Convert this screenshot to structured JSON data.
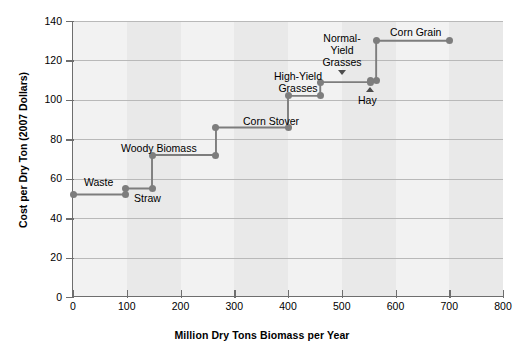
{
  "chart_data": {
    "type": "line",
    "title": "",
    "xlabel": "Million Dry Tons Biomass per Year",
    "ylabel": "Cost per Dry Ton (2007 Dollars)",
    "xlim": [
      0,
      800
    ],
    "ylim": [
      0,
      140
    ],
    "xticks": [
      0,
      100,
      200,
      300,
      400,
      500,
      600,
      700,
      800
    ],
    "yticks": [
      0,
      20,
      40,
      60,
      80,
      100,
      120,
      140
    ],
    "grid": "horizontal",
    "legend": "none",
    "style": "step supply curve with vertical risers and round markers",
    "series_color": "#7d7d7d",
    "steps": [
      {
        "label": "Waste",
        "x_start": 0,
        "x_end": 98,
        "cost": 52
      },
      {
        "label": "Straw",
        "x_start": 98,
        "x_end": 147,
        "cost": 55
      },
      {
        "label": "Woody Biomass",
        "x_start": 147,
        "x_end": 266,
        "cost": 72
      },
      {
        "label": "Corn Stover",
        "x_start": 266,
        "x_end": 400,
        "cost": 86
      },
      {
        "label": "",
        "x_start": 400,
        "x_end": 460,
        "cost": 102
      },
      {
        "label": "High-Yield Grasses",
        "x_start": 460,
        "x_end": 553,
        "cost": 109
      },
      {
        "label": "Hay",
        "x_start": 553,
        "x_end": 564,
        "cost": 110
      },
      {
        "label": "Corn Grain",
        "x_start": 564,
        "x_end": 701,
        "cost": 130
      }
    ],
    "annotations": [
      {
        "name": "waste",
        "text": "Waste"
      },
      {
        "name": "straw",
        "text": "Straw"
      },
      {
        "name": "woody-biomass",
        "text": "Woody Biomass"
      },
      {
        "name": "corn-stover",
        "text": "Corn Stover"
      },
      {
        "name": "high-yield-grasses",
        "text": "High-Yield\nGrasses"
      },
      {
        "name": "normal-yield-grasses",
        "text": "Normal-\nYield\nGrasses"
      },
      {
        "name": "hay",
        "text": "Hay"
      },
      {
        "name": "corn-grain",
        "text": "Corn Grain"
      }
    ]
  },
  "labels": {
    "waste": "Waste",
    "straw": "Straw",
    "woody_biomass": "Woody Biomass",
    "corn_stover": "Corn Stover",
    "high_yield_1": "High-Yield",
    "high_yield_2": "Grasses",
    "normal_yield_1": "Normal-",
    "normal_yield_2": "Yield",
    "normal_yield_3": "Grasses",
    "hay": "Hay",
    "corn_grain": "Corn Grain"
  },
  "axes": {
    "xlabel": "Million Dry Tons Biomass per Year",
    "ylabel": "Cost per Dry Ton (2007 Dollars)",
    "xticklabels": [
      "0",
      "100",
      "200",
      "300",
      "400",
      "500",
      "600",
      "700",
      "800"
    ],
    "yticklabels": [
      "0",
      "20",
      "40",
      "60",
      "80",
      "100",
      "120",
      "140"
    ]
  },
  "colors": {
    "series": "#7d7d7d",
    "grid": "#b9b9b9",
    "axis": "#6e6e6e",
    "plot_bg": "#f2f2f2",
    "band": "#e9e9e9"
  }
}
